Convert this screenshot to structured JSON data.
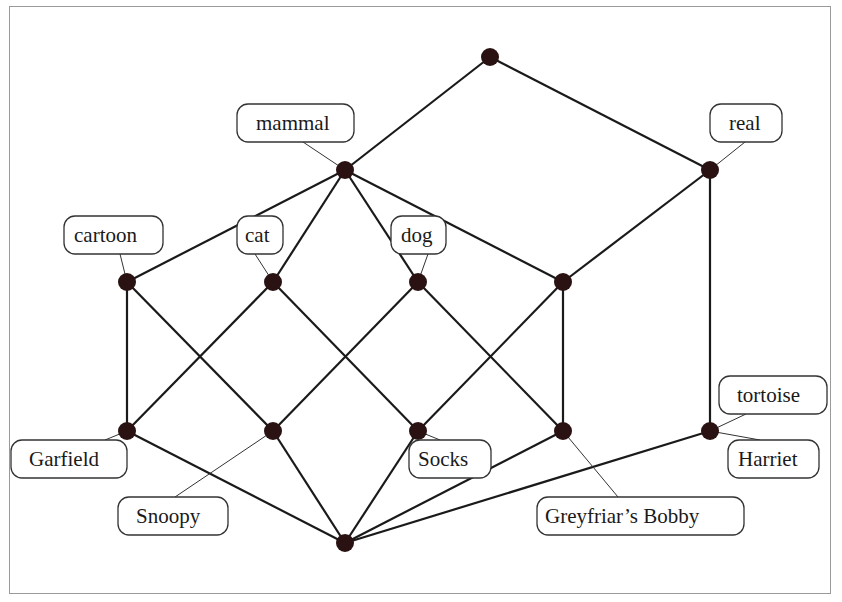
{
  "diagram": {
    "type": "concept-lattice",
    "nodes": [
      {
        "id": "top",
        "x": 490,
        "y": 57
      },
      {
        "id": "mammal",
        "x": 345,
        "y": 170
      },
      {
        "id": "real",
        "x": 710,
        "y": 170
      },
      {
        "id": "cartoon",
        "x": 127,
        "y": 282
      },
      {
        "id": "cat",
        "x": 273,
        "y": 282
      },
      {
        "id": "dog",
        "x": 418,
        "y": 282
      },
      {
        "id": "real-mammal",
        "x": 563,
        "y": 282
      },
      {
        "id": "Garfield",
        "x": 127,
        "y": 431
      },
      {
        "id": "Snoopy",
        "x": 273,
        "y": 431
      },
      {
        "id": "Socks",
        "x": 418,
        "y": 431
      },
      {
        "id": "Greyfriars-Bobby",
        "x": 563,
        "y": 431
      },
      {
        "id": "tortoise-Harriet",
        "x": 710,
        "y": 431
      },
      {
        "id": "bottom",
        "x": 345,
        "y": 543
      }
    ],
    "edges": [
      [
        "top",
        "mammal"
      ],
      [
        "top",
        "real"
      ],
      [
        "mammal",
        "cartoon"
      ],
      [
        "mammal",
        "cat"
      ],
      [
        "mammal",
        "dog"
      ],
      [
        "mammal",
        "real-mammal"
      ],
      [
        "real",
        "real-mammal"
      ],
      [
        "real",
        "tortoise-Harriet"
      ],
      [
        "cartoon",
        "Garfield"
      ],
      [
        "cartoon",
        "Snoopy"
      ],
      [
        "cat",
        "Garfield"
      ],
      [
        "cat",
        "Socks"
      ],
      [
        "dog",
        "Snoopy"
      ],
      [
        "dog",
        "Greyfriars-Bobby"
      ],
      [
        "real-mammal",
        "Socks"
      ],
      [
        "real-mammal",
        "Greyfriars-Bobby"
      ],
      [
        "Garfield",
        "bottom"
      ],
      [
        "Snoopy",
        "bottom"
      ],
      [
        "Socks",
        "bottom"
      ],
      [
        "Greyfriars-Bobby",
        "bottom"
      ],
      [
        "tortoise-Harriet",
        "bottom"
      ]
    ],
    "labels": [
      {
        "text": "mammal",
        "node": "mammal",
        "bx": 237,
        "by": 104,
        "bw": 117,
        "bh": 38,
        "tx": 256,
        "ax": 303,
        "ay": 142
      },
      {
        "text": "real",
        "node": "real",
        "bx": 710,
        "by": 104,
        "bw": 72,
        "bh": 38,
        "tx": 729,
        "ax": 745,
        "ay": 142
      },
      {
        "text": "cartoon",
        "node": "cartoon",
        "bx": 64,
        "by": 216,
        "bw": 99,
        "bh": 38,
        "tx": 74,
        "ax": 120,
        "ay": 254
      },
      {
        "text": "cat",
        "node": "cat",
        "bx": 237,
        "by": 216,
        "bw": 46,
        "bh": 38,
        "tx": 245,
        "ax": 255,
        "ay": 254
      },
      {
        "text": "dog",
        "node": "dog",
        "bx": 391,
        "by": 216,
        "bw": 55,
        "bh": 38,
        "tx": 401,
        "ax": 428,
        "ay": 254
      },
      {
        "text": "Garfield",
        "node": "Garfield",
        "bx": 11,
        "by": 440,
        "bw": 116,
        "bh": 38,
        "tx": 29,
        "ax": 105,
        "ay": 440
      },
      {
        "text": "Snoopy",
        "node": "Snoopy",
        "bx": 118,
        "by": 497,
        "bw": 110,
        "bh": 38,
        "tx": 136,
        "ax": 175,
        "ay": 497
      },
      {
        "text": "Socks",
        "node": "Socks",
        "bx": 409,
        "by": 440,
        "bw": 82,
        "bh": 38,
        "tx": 418,
        "ax": 440,
        "ay": 440
      },
      {
        "text": "Greyfriar’s Bobby",
        "node": "Greyfriars-Bobby",
        "bx": 537,
        "by": 497,
        "bw": 207,
        "bh": 38,
        "tx": 545,
        "ax": 618,
        "ay": 497
      },
      {
        "text": "tortoise",
        "node": "tortoise-Harriet",
        "bx": 719,
        "by": 376,
        "bw": 108,
        "bh": 38,
        "tx": 737,
        "ax": 746,
        "ay": 414
      },
      {
        "text": "Harriet",
        "node": "tortoise-Harriet",
        "bx": 728,
        "by": 440,
        "bw": 91,
        "bh": 38,
        "tx": 738,
        "ax": 760,
        "ay": 440
      }
    ]
  },
  "colors": {
    "node": "#2a1212",
    "edge": "#1a1a1a",
    "frame": "#9a9a9a",
    "background": "#ffffff"
  }
}
